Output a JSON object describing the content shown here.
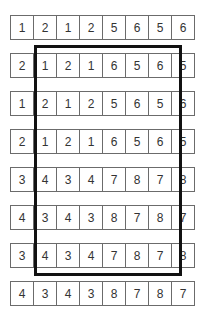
{
  "grid": {
    "rows": [
      {
        "cells": [
          "1",
          "2",
          "1",
          "2",
          "5",
          "6",
          "5",
          "6"
        ]
      },
      {
        "cells": [
          "2",
          "1",
          "2",
          "1",
          "6",
          "5",
          "6",
          "5"
        ]
      },
      {
        "cells": [
          "1",
          "2",
          "1",
          "2",
          "5",
          "6",
          "5",
          "6"
        ]
      },
      {
        "cells": [
          "2",
          "1",
          "2",
          "1",
          "6",
          "5",
          "6",
          "5"
        ]
      },
      {
        "cells": [
          "3",
          "4",
          "3",
          "4",
          "7",
          "8",
          "7",
          "8"
        ]
      },
      {
        "cells": [
          "4",
          "3",
          "4",
          "3",
          "8",
          "7",
          "8",
          "7"
        ]
      },
      {
        "cells": [
          "3",
          "4",
          "3",
          "4",
          "7",
          "8",
          "7",
          "8"
        ]
      },
      {
        "cells": [
          "4",
          "3",
          "4",
          "3",
          "8",
          "7",
          "8",
          "7"
        ]
      }
    ]
  },
  "highlight": {
    "label": "selected-region",
    "rows": [
      1,
      6
    ],
    "cols": [
      1,
      6
    ],
    "border_color": "#111111"
  },
  "colors": {
    "cell_border": "#6b6b6b",
    "text": "#333333",
    "background": "#ffffff"
  }
}
